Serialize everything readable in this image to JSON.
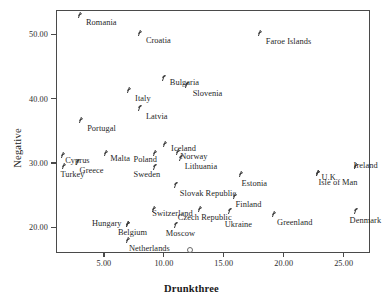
{
  "chart_data": {
    "type": "scatter",
    "title": "",
    "xlabel": "Drunkthree",
    "ylabel": "Negative",
    "xlim": [
      1.0,
      27.2
    ],
    "ylim": [
      16.0,
      53.8
    ],
    "xticks": [
      5.0,
      10.0,
      15.0,
      20.0,
      25.0
    ],
    "xticklabels": [
      "5.00",
      "10.00",
      "15.00",
      "20.00",
      "25.00"
    ],
    "yticks": [
      20.0,
      30.0,
      40.0,
      50.0
    ],
    "yticklabels": [
      "20.00",
      "30.00",
      "40.00",
      "50.00"
    ],
    "grid": false,
    "legend": null,
    "marker": "pound-sign",
    "points": [
      {
        "label": "Romania",
        "x": 3.0,
        "y": 53.0,
        "lx": 6,
        "ly": 3
      },
      {
        "label": "Croatia",
        "x": 8.0,
        "y": 50.2,
        "lx": 6,
        "ly": 3
      },
      {
        "label": "Faroe Islands",
        "x": 18.0,
        "y": 50.2,
        "lx": 6,
        "ly": 4
      },
      {
        "label": "Bulgaria",
        "x": 10.0,
        "y": 43.3,
        "lx": 6,
        "ly": 0
      },
      {
        "label": "Slovenia",
        "x": 11.9,
        "y": 42.2,
        "lx": 6,
        "ly": 4
      },
      {
        "label": "Italy",
        "x": 7.1,
        "y": 41.3,
        "lx": 6,
        "ly": 4
      },
      {
        "label": "Latvia",
        "x": 8.0,
        "y": 38.6,
        "lx": 6,
        "ly": 4
      },
      {
        "label": "Portugal",
        "x": 3.1,
        "y": 36.7,
        "lx": 6,
        "ly": 4
      },
      {
        "label": "Iceland",
        "x": 10.1,
        "y": 32.9,
        "lx": 6,
        "ly": 0
      },
      {
        "label": "Norway",
        "x": 11.2,
        "y": 31.7,
        "lx": 2,
        "ly": 0
      },
      {
        "label": "Malta",
        "x": 5.2,
        "y": 31.5,
        "lx": 4,
        "ly": 1
      },
      {
        "label": "Cyprus",
        "x": 1.6,
        "y": 31.2,
        "lx": 2,
        "ly": 1
      },
      {
        "label": "Poland",
        "x": 9.3,
        "y": 31.5,
        "lx": -22,
        "ly": 2
      },
      {
        "label": "Lithuania",
        "x": 11.4,
        "y": 30.8,
        "lx": 4,
        "ly": 4
      },
      {
        "label": "Ireland",
        "x": 26.0,
        "y": 29.5,
        "lx": -2,
        "ly": -5
      },
      {
        "label": "Greece",
        "x": 2.8,
        "y": 30.2,
        "lx": 2,
        "ly": 4
      },
      {
        "label": "Turkey",
        "x": 1.7,
        "y": 29.5,
        "lx": -4,
        "ly": 4
      },
      {
        "label": "Sweden",
        "x": 9.3,
        "y": 29.4,
        "lx": -22,
        "ly": 3
      },
      {
        "label": "U.K.",
        "x": 22.9,
        "y": 28.4,
        "lx": 3,
        "ly": 0
      },
      {
        "label": "Isle of Man",
        "x": 22.9,
        "y": 28.4,
        "lx": 0,
        "ly": 5
      },
      {
        "label": "Estonia",
        "x": 16.4,
        "y": 28.3,
        "lx": 1,
        "ly": 5
      },
      {
        "label": "Slovak Republic",
        "x": 11.0,
        "y": 26.6,
        "lx": 4,
        "ly": 4
      },
      {
        "label": "Finland",
        "x": 15.9,
        "y": 24.8,
        "lx": 1,
        "ly": 4
      },
      {
        "label": "Switzerland",
        "x": 9.2,
        "y": 22.8,
        "lx": -2,
        "ly": 0
      },
      {
        "label": "Czech Republic",
        "x": 13.0,
        "y": 22.8,
        "lx": -22,
        "ly": 4
      },
      {
        "label": "Ukraine",
        "x": 15.5,
        "y": 22.6,
        "lx": -5,
        "ly": 9
      },
      {
        "label": "Denmark",
        "x": 26.0,
        "y": 22.6,
        "lx": -6,
        "ly": 5
      },
      {
        "label": "Hungary",
        "x": 7.0,
        "y": 20.5,
        "lx": -36,
        "ly": -5
      },
      {
        "label": "Greenland",
        "x": 19.2,
        "y": 22.0,
        "lx": 3,
        "ly": 4
      },
      {
        "label": "Belgium",
        "x": 7.0,
        "y": 20.5,
        "lx": -10,
        "ly": 4
      },
      {
        "label": "Moscow",
        "x": 11.0,
        "y": 20.4,
        "lx": -10,
        "ly": 4
      },
      {
        "label": "Netherlands",
        "x": 7.0,
        "y": 18.0,
        "lx": 1,
        "ly": 4
      }
    ],
    "outliers": [
      {
        "x": 12.1,
        "y": 16.7
      }
    ]
  }
}
